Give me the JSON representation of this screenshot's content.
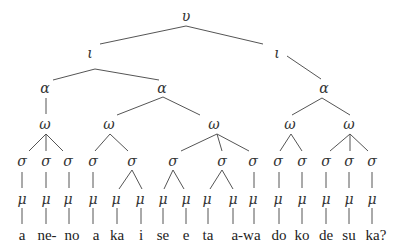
{
  "diagram": {
    "type": "prosodic-tree",
    "labels": {
      "utterance": "υ",
      "intonation_phrase": "ι",
      "accentual_phrase": "α",
      "prosodic_word": "ω",
      "syllable": "σ",
      "mora": "μ"
    },
    "words": [
      "a",
      "ne-",
      "no",
      "a",
      "ka",
      "i",
      "se",
      "e",
      "ta",
      "a-wa",
      "do",
      "ko",
      "de",
      "su",
      "ka?"
    ],
    "nodes": [
      {
        "id": "u",
        "label": "υ",
        "x": 186,
        "y": 16
      },
      {
        "id": "i1",
        "label": "ι",
        "x": 90,
        "y": 53
      },
      {
        "id": "i2",
        "label": "ι",
        "x": 277,
        "y": 53
      },
      {
        "id": "a1",
        "label": "α",
        "x": 45,
        "y": 88
      },
      {
        "id": "a2",
        "label": "α",
        "x": 162,
        "y": 88
      },
      {
        "id": "a3",
        "label": "α",
        "x": 324,
        "y": 88
      },
      {
        "id": "w1",
        "label": "ω",
        "x": 45,
        "y": 124
      },
      {
        "id": "w2",
        "label": "ω",
        "x": 109,
        "y": 124
      },
      {
        "id": "w3",
        "label": "ω",
        "x": 214,
        "y": 124
      },
      {
        "id": "w4",
        "label": "ω",
        "x": 290,
        "y": 124
      },
      {
        "id": "w5",
        "label": "ω",
        "x": 349,
        "y": 124
      },
      {
        "id": "s1",
        "label": "σ",
        "x": 22,
        "y": 161
      },
      {
        "id": "s2",
        "label": "σ",
        "x": 46,
        "y": 161
      },
      {
        "id": "s3",
        "label": "σ",
        "x": 68,
        "y": 161
      },
      {
        "id": "s4",
        "label": "σ",
        "x": 93,
        "y": 161
      },
      {
        "id": "s5",
        "label": "σ",
        "x": 132,
        "y": 161
      },
      {
        "id": "s6",
        "label": "σ",
        "x": 173,
        "y": 161
      },
      {
        "id": "s7",
        "label": "σ",
        "x": 222,
        "y": 161
      },
      {
        "id": "s8",
        "label": "σ",
        "x": 253,
        "y": 161
      },
      {
        "id": "s9",
        "label": "σ",
        "x": 278,
        "y": 161
      },
      {
        "id": "s10",
        "label": "σ",
        "x": 302,
        "y": 161
      },
      {
        "id": "s11",
        "label": "σ",
        "x": 326,
        "y": 161
      },
      {
        "id": "s12",
        "label": "σ",
        "x": 349,
        "y": 161
      },
      {
        "id": "s13",
        "label": "σ",
        "x": 372,
        "y": 161
      },
      {
        "id": "m1",
        "label": "μ",
        "x": 22,
        "y": 199
      },
      {
        "id": "m2",
        "label": "μ",
        "x": 46,
        "y": 199
      },
      {
        "id": "m3",
        "label": "μ",
        "x": 68,
        "y": 199
      },
      {
        "id": "m4",
        "label": "μ",
        "x": 93,
        "y": 199
      },
      {
        "id": "m5",
        "label": "μ",
        "x": 116,
        "y": 199
      },
      {
        "id": "m6",
        "label": "μ",
        "x": 140,
        "y": 199
      },
      {
        "id": "m7",
        "label": "μ",
        "x": 163,
        "y": 199
      },
      {
        "id": "m8",
        "label": "μ",
        "x": 186,
        "y": 199
      },
      {
        "id": "m9",
        "label": "μ",
        "x": 207,
        "y": 199
      },
      {
        "id": "m10",
        "label": "μ",
        "x": 233,
        "y": 199
      },
      {
        "id": "m11",
        "label": "μ",
        "x": 253,
        "y": 199
      },
      {
        "id": "m12",
        "label": "μ",
        "x": 278,
        "y": 199
      },
      {
        "id": "m13",
        "label": "μ",
        "x": 302,
        "y": 199
      },
      {
        "id": "m14",
        "label": "μ",
        "x": 326,
        "y": 199
      },
      {
        "id": "m15",
        "label": "μ",
        "x": 349,
        "y": 199
      },
      {
        "id": "m16",
        "label": "μ",
        "x": 372,
        "y": 199
      }
    ],
    "word_positions": [
      22,
      46,
      68,
      93,
      116,
      140,
      163,
      186,
      207,
      233,
      253,
      278,
      302,
      326,
      372
    ]
  }
}
